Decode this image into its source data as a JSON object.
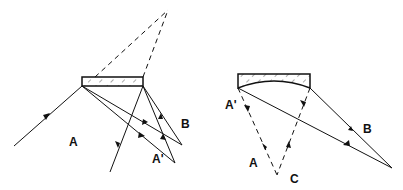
{
  "left_diagram": {
    "labels": {
      "a": "A",
      "b": "B",
      "a_prime": "A'"
    }
  },
  "right_diagram": {
    "labels": {
      "a": "A",
      "b": "B",
      "c": "C",
      "a_prime": "A'"
    }
  },
  "colors": {
    "line": "#111111",
    "background": "#ffffff"
  }
}
